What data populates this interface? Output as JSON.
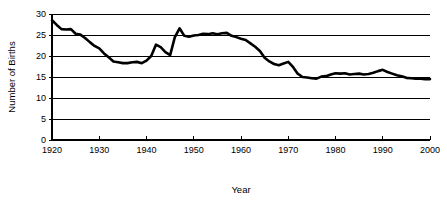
{
  "chart_data": {
    "type": "line",
    "title": "",
    "xlabel": "Year",
    "ylabel": "Number of Births",
    "xlim": [
      1920,
      2000
    ],
    "ylim": [
      0,
      30
    ],
    "xticks": [
      1920,
      1930,
      1940,
      1950,
      1960,
      1970,
      1980,
      1990,
      2000
    ],
    "xtick_labels": [
      "1920",
      "1930",
      "1940",
      "1950",
      "1960",
      "1970",
      "1980",
      "1990",
      "2000"
    ],
    "yticks": [
      0,
      5,
      10,
      15,
      20,
      25,
      30
    ],
    "ytick_labels": [
      "0",
      "5",
      "10",
      "15",
      "20",
      "25",
      "30"
    ],
    "grid": "horizontal",
    "legend": "none",
    "line_color": "#000000",
    "line_width": 2.6,
    "series": [
      {
        "name": "Number of Births",
        "x": [
          1920,
          1921,
          1922,
          1923,
          1924,
          1925,
          1926,
          1927,
          1928,
          1929,
          1930,
          1931,
          1932,
          1933,
          1934,
          1935,
          1936,
          1937,
          1938,
          1939,
          1940,
          1941,
          1942,
          1943,
          1944,
          1945,
          1946,
          1947,
          1948,
          1949,
          1950,
          1951,
          1952,
          1953,
          1954,
          1955,
          1956,
          1957,
          1958,
          1959,
          1960,
          1961,
          1962,
          1963,
          1964,
          1965,
          1966,
          1967,
          1968,
          1969,
          1970,
          1971,
          1972,
          1973,
          1974,
          1975,
          1976,
          1977,
          1978,
          1979,
          1980,
          1981,
          1982,
          1983,
          1984,
          1985,
          1986,
          1987,
          1988,
          1989,
          1990,
          1991,
          1992,
          1993,
          1994,
          1995,
          1996,
          1997,
          1998,
          1999,
          2000
        ],
        "values": [
          28.5,
          27.4,
          26.4,
          26.3,
          26.4,
          25.3,
          25.1,
          24.3,
          23.3,
          22.4,
          21.8,
          20.6,
          19.7,
          18.7,
          18.5,
          18.3,
          18.3,
          18.5,
          18.6,
          18.3,
          18.9,
          20.0,
          22.7,
          22.1,
          20.9,
          20.2,
          24.5,
          26.6,
          24.8,
          24.6,
          24.9,
          25.0,
          25.3,
          25.2,
          25.4,
          25.2,
          25.4,
          25.5,
          24.8,
          24.5,
          24.1,
          23.8,
          23.0,
          22.2,
          21.2,
          19.6,
          18.7,
          18.1,
          17.8,
          18.2,
          18.6,
          17.4,
          15.8,
          15.0,
          14.9,
          14.7,
          14.6,
          15.1,
          15.2,
          15.6,
          15.9,
          15.8,
          15.9,
          15.6,
          15.7,
          15.8,
          15.6,
          15.7,
          16.0,
          16.4,
          16.7,
          16.2,
          15.8,
          15.4,
          15.2,
          14.8,
          14.7,
          14.6,
          14.6,
          14.5,
          14.5
        ]
      }
    ]
  }
}
